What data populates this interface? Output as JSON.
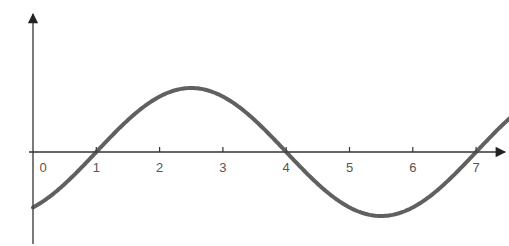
{
  "chart_data": {
    "type": "line",
    "title": "",
    "xlabel": "",
    "ylabel": "",
    "x_ticks": [
      "0",
      "1",
      "2",
      "3",
      "4",
      "5",
      "6",
      "7"
    ],
    "xlim": [
      0,
      7.5
    ],
    "ylim": [
      -1.3,
      2.3
    ],
    "grid": false,
    "legend": null,
    "series": [
      {
        "name": "sine wave",
        "function": "sin(pi*(x-1)/3)",
        "x": [
          0,
          0.5,
          1,
          1.5,
          2,
          2.5,
          3,
          3.5,
          4,
          4.5,
          5,
          5.5,
          6,
          6.5,
          7,
          7.5
        ],
        "values": [
          -0.87,
          -0.5,
          0,
          0.5,
          0.87,
          1,
          0.87,
          0.5,
          0,
          -0.5,
          -0.87,
          -1,
          -0.87,
          -0.5,
          0,
          0.5
        ],
        "zero_crossings": [
          1,
          4,
          7
        ],
        "maximum": {
          "x": 2.5,
          "y": 1
        },
        "minimum": {
          "x": 5.5,
          "y": -1
        }
      }
    ]
  },
  "axes": {
    "color": "#333333",
    "curve_color": "#444444"
  }
}
